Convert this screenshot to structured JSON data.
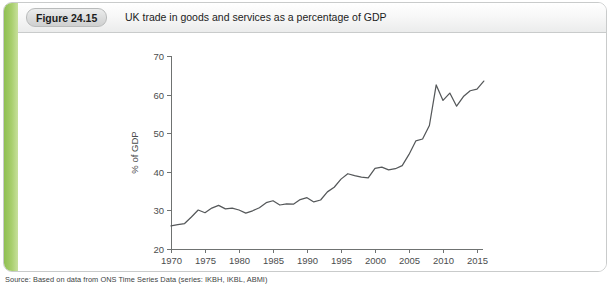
{
  "figure": {
    "badge_label": "Figure 24.15",
    "title": "UK trade in goods and services as a percentage of GDP",
    "source": "Source: Based on data from ONS Time Series Data (series: IKBH, IKBL, ABMI)",
    "accent_color": "#8fbf52",
    "line_color": "#55585a",
    "axis_color": "#6f7271"
  },
  "chart_data": {
    "type": "line",
    "title": "UK trade in goods and services as a percentage of GDP",
    "xlabel": "",
    "ylabel": "% of GDP",
    "xlim": [
      1970,
      2016
    ],
    "ylim": [
      20,
      70
    ],
    "xticks": [
      1970,
      1975,
      1980,
      1985,
      1990,
      1995,
      2000,
      2005,
      2010,
      2015
    ],
    "yticks": [
      20,
      30,
      40,
      50,
      60,
      70
    ],
    "grid": false,
    "legend": false,
    "series": [
      {
        "name": "UK trade in goods and services (% of GDP)",
        "x": [
          1970,
          1971,
          1972,
          1973,
          1974,
          1975,
          1976,
          1977,
          1978,
          1979,
          1980,
          1981,
          1982,
          1983,
          1984,
          1985,
          1986,
          1987,
          1988,
          1989,
          1990,
          1991,
          1992,
          1993,
          1994,
          1995,
          1996,
          1997,
          1998,
          1999,
          2000,
          2001,
          2002,
          2003,
          2004,
          2005,
          2006,
          2007,
          2008,
          2009,
          2010,
          2011,
          2012,
          2013,
          2014,
          2015,
          2016
        ],
        "values": [
          26.0,
          26.3,
          26.6,
          28.3,
          30.1,
          29.4,
          30.6,
          31.3,
          30.4,
          30.6,
          30.1,
          29.3,
          29.9,
          30.7,
          32.0,
          32.5,
          31.4,
          31.7,
          31.6,
          32.8,
          33.3,
          32.2,
          32.7,
          34.8,
          36.0,
          38.1,
          39.5,
          39.0,
          38.6,
          38.4,
          40.9,
          41.2,
          40.5,
          40.8,
          41.6,
          44.5,
          48.0,
          48.5,
          52.0,
          62.5,
          58.5,
          60.4,
          57.0,
          59.5,
          61.0,
          61.4,
          63.5
        ]
      }
    ]
  }
}
